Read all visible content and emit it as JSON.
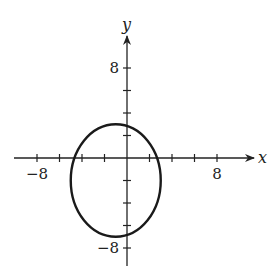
{
  "chart_data": {
    "type": "line",
    "title": "",
    "xlabel": "x",
    "ylabel": "y",
    "xlim": [
      -10,
      12
    ],
    "ylim": [
      -10,
      12
    ],
    "grid": false,
    "x_tick_labels": [
      {
        "value": -8,
        "label": "−8"
      },
      {
        "value": 8,
        "label": "8"
      }
    ],
    "y_tick_labels": [
      {
        "value": 8,
        "label": "8"
      },
      {
        "value": -8,
        "label": "−8"
      }
    ],
    "tick_step": 2,
    "series": [
      {
        "name": "ellipse",
        "equation": "(x+1)^2/16 + (y+2)^2/25 = 1",
        "center": [
          -1,
          -2
        ],
        "semi_axis_x": 4,
        "semi_axis_y": 5
      }
    ]
  },
  "colors": {
    "axis": "#222222",
    "curve": "#1a1a1a"
  }
}
